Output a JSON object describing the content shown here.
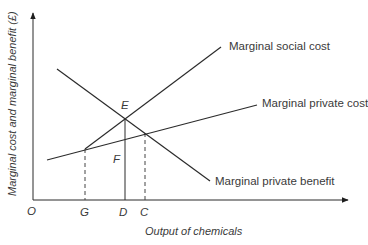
{
  "diagram": {
    "type": "economics-externality",
    "axes": {
      "y_label": "Marginal cost and marginal benefit (£)",
      "x_label": "Output of chemicals",
      "origin_label": "O"
    },
    "curves": {
      "msc": {
        "label": "Marginal social cost"
      },
      "mpc": {
        "label": "Marginal private  cost"
      },
      "mpb": {
        "label": "Marginal private  benefit"
      }
    },
    "points": {
      "e": "E",
      "f": "F"
    },
    "x_ticks": {
      "g": "G",
      "d": "D",
      "c": "C"
    },
    "colors": {
      "line": "#2b2b2b",
      "text": "#3a3a3a",
      "background": "#ffffff"
    }
  }
}
